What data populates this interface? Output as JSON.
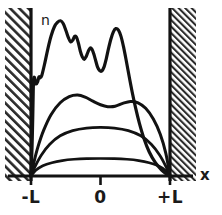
{
  "figure": {
    "background_color": "#ffffff",
    "ink_color": "#121212",
    "width": 222,
    "height": 215
  },
  "axes": {
    "x_axis_label": "x",
    "y_axis_label": "n",
    "x_ticks": [
      {
        "label": "-L",
        "value": -1,
        "px": 31
      },
      {
        "label": "0",
        "value": 0,
        "px": 100.5
      },
      {
        "label": "+L",
        "value": 1,
        "px": 170
      }
    ],
    "baseline_y_px": 176,
    "x_axis_left_px": 8,
    "x_axis_right_px": 193
  },
  "walls": {
    "left": {
      "name": "left-potential-wall",
      "x_px": 31,
      "top_px": 8,
      "bottom_px": 181,
      "hatch_left_px": 5,
      "hatch_right_px": 30,
      "hatch_angle_deg": 45,
      "hatch_spacing_px": 4.5
    },
    "right": {
      "name": "right-potential-wall",
      "x_px": 170,
      "top_px": 8,
      "bottom_px": 181,
      "hatch_left_px": 171,
      "hatch_right_px": 196,
      "hatch_angle_deg": 45,
      "hatch_spacing_px": 3.2
    }
  },
  "chart_data": {
    "type": "line",
    "xlabel": "x",
    "ylabel": "n",
    "xlim": [
      -1,
      1
    ],
    "ylim": [
      0,
      1
    ],
    "grid": false,
    "legend": "none",
    "x_tick_labels": [
      "-L",
      "0",
      "+L"
    ],
    "x_tick_values": [
      -1,
      0,
      1
    ],
    "annotations": [
      {
        "text": "n",
        "x": -0.86,
        "y": 0.93,
        "name": "n-axis-annotation"
      },
      {
        "text": "x",
        "x": 1.32,
        "y": 0.075,
        "name": "x-axis-annotation"
      }
    ],
    "series": [
      {
        "name": "curve-1-ground-state",
        "description": "lowest flat arc, single broad low hump",
        "stroke_width": 2.6,
        "points": [
          [
            -1.0,
            0.0
          ],
          [
            -0.93,
            0.035
          ],
          [
            -0.83,
            0.063
          ],
          [
            -0.7,
            0.082
          ],
          [
            -0.55,
            0.095
          ],
          [
            -0.38,
            0.103
          ],
          [
            -0.2,
            0.107
          ],
          [
            0.0,
            0.108
          ],
          [
            0.2,
            0.107
          ],
          [
            0.38,
            0.103
          ],
          [
            0.55,
            0.095
          ],
          [
            0.7,
            0.082
          ],
          [
            0.83,
            0.063
          ],
          [
            0.93,
            0.035
          ],
          [
            1.0,
            0.0
          ]
        ]
      },
      {
        "name": "curve-2-parabolic-arc",
        "description": "medium parabolic arc, single dome",
        "stroke_width": 2.8,
        "points": [
          [
            -1.0,
            0.0
          ],
          [
            -0.94,
            0.06
          ],
          [
            -0.85,
            0.13
          ],
          [
            -0.73,
            0.196
          ],
          [
            -0.58,
            0.248
          ],
          [
            -0.4,
            0.28
          ],
          [
            -0.2,
            0.296
          ],
          [
            0.0,
            0.3
          ],
          [
            0.2,
            0.296
          ],
          [
            0.4,
            0.28
          ],
          [
            0.58,
            0.248
          ],
          [
            0.73,
            0.196
          ],
          [
            0.85,
            0.13
          ],
          [
            0.94,
            0.06
          ],
          [
            1.0,
            0.0
          ]
        ]
      },
      {
        "name": "curve-3-double-hump",
        "description": "double-humped curve with central dip",
        "stroke_width": 3.0,
        "points": [
          [
            -1.0,
            0.0
          ],
          [
            -0.955,
            0.09
          ],
          [
            -0.9,
            0.18
          ],
          [
            -0.82,
            0.28
          ],
          [
            -0.71,
            0.38
          ],
          [
            -0.58,
            0.452
          ],
          [
            -0.45,
            0.49
          ],
          [
            -0.33,
            0.5
          ],
          [
            -0.22,
            0.487
          ],
          [
            -0.11,
            0.462
          ],
          [
            0.0,
            0.44
          ],
          [
            0.105,
            0.428
          ],
          [
            0.21,
            0.43
          ],
          [
            0.32,
            0.448
          ],
          [
            0.43,
            0.46
          ],
          [
            0.54,
            0.452
          ],
          [
            0.65,
            0.418
          ],
          [
            0.76,
            0.352
          ],
          [
            0.86,
            0.258
          ],
          [
            0.94,
            0.14
          ],
          [
            1.0,
            0.0
          ]
        ]
      },
      {
        "name": "curve-4-high-n-oscillatory",
        "description": "highly oscillatory top curve with many peaks and troughs",
        "stroke_width": 3.2,
        "points": [
          [
            -1.0,
            0.0
          ],
          [
            -0.985,
            0.18
          ],
          [
            -0.975,
            0.36
          ],
          [
            -0.968,
            0.52
          ],
          [
            -0.962,
            0.6
          ],
          [
            -0.95,
            0.608
          ],
          [
            -0.938,
            0.585
          ],
          [
            -0.925,
            0.568
          ],
          [
            -0.905,
            0.58
          ],
          [
            -0.885,
            0.612
          ],
          [
            -0.868,
            0.606
          ],
          [
            -0.845,
            0.62
          ],
          [
            -0.8,
            0.7
          ],
          [
            -0.755,
            0.79
          ],
          [
            -0.71,
            0.866
          ],
          [
            -0.665,
            0.92
          ],
          [
            -0.62,
            0.948
          ],
          [
            -0.575,
            0.958
          ],
          [
            -0.535,
            0.94
          ],
          [
            -0.495,
            0.895
          ],
          [
            -0.46,
            0.852
          ],
          [
            -0.43,
            0.828
          ],
          [
            -0.4,
            0.838
          ],
          [
            -0.372,
            0.862
          ],
          [
            -0.345,
            0.856
          ],
          [
            -0.318,
            0.82
          ],
          [
            -0.29,
            0.77
          ],
          [
            -0.262,
            0.735
          ],
          [
            -0.235,
            0.72
          ],
          [
            -0.205,
            0.738
          ],
          [
            -0.178,
            0.768
          ],
          [
            -0.15,
            0.79
          ],
          [
            -0.122,
            0.782
          ],
          [
            -0.095,
            0.752
          ],
          [
            -0.068,
            0.71
          ],
          [
            -0.042,
            0.672
          ],
          [
            -0.012,
            0.65
          ],
          [
            0.018,
            0.648
          ],
          [
            0.05,
            0.672
          ],
          [
            0.082,
            0.722
          ],
          [
            0.115,
            0.786
          ],
          [
            0.15,
            0.846
          ],
          [
            0.185,
            0.89
          ],
          [
            0.22,
            0.91
          ],
          [
            0.258,
            0.9
          ],
          [
            0.295,
            0.862
          ],
          [
            0.33,
            0.8
          ],
          [
            0.368,
            0.718
          ],
          [
            0.41,
            0.62
          ],
          [
            0.455,
            0.52
          ],
          [
            0.505,
            0.42
          ],
          [
            0.56,
            0.325
          ],
          [
            0.625,
            0.232
          ],
          [
            0.7,
            0.15
          ],
          [
            0.79,
            0.082
          ],
          [
            0.88,
            0.036
          ],
          [
            0.95,
            0.012
          ],
          [
            1.0,
            0.0
          ]
        ]
      }
    ]
  }
}
